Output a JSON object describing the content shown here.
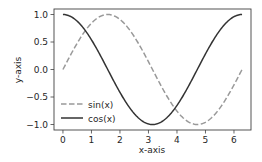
{
  "chart_data": {
    "type": "line",
    "title": "",
    "xlabel": "x-axis",
    "ylabel": "y-axis",
    "xlim": [
      -0.314,
      6.597
    ],
    "ylim": [
      -1.1,
      1.1
    ],
    "xticks": [
      0,
      1,
      2,
      3,
      4,
      5,
      6
    ],
    "xtick_labels": [
      "0",
      "1",
      "2",
      "3",
      "4",
      "5",
      "6"
    ],
    "yticks": [
      1.0,
      0.5,
      0.0,
      -0.5,
      -1.0
    ],
    "ytick_labels": [
      "1.0",
      "0.5",
      "0.0",
      "−0.5",
      "−1.0"
    ],
    "grid": false,
    "legend_position": "lower left",
    "x_domain": [
      0,
      6.2832
    ],
    "series": [
      {
        "name": "sin(x)",
        "function": "sin",
        "color": "#999999",
        "linestyle": "dashed"
      },
      {
        "name": "cos(x)",
        "function": "cos",
        "color": "#333333",
        "linestyle": "solid"
      }
    ],
    "sample_points": {
      "x": [
        0,
        0.785,
        1.571,
        2.356,
        3.142,
        3.927,
        4.712,
        5.498,
        6.283
      ],
      "sin(x)": [
        0,
        0.707,
        1.0,
        0.707,
        0,
        -0.707,
        -1.0,
        -0.707,
        0
      ],
      "cos(x)": [
        1.0,
        0.707,
        0,
        -0.707,
        -1.0,
        -0.707,
        0,
        0.707,
        1.0
      ]
    }
  },
  "legend": {
    "items": [
      {
        "label": "sin(x)"
      },
      {
        "label": "cos(x)"
      }
    ]
  }
}
